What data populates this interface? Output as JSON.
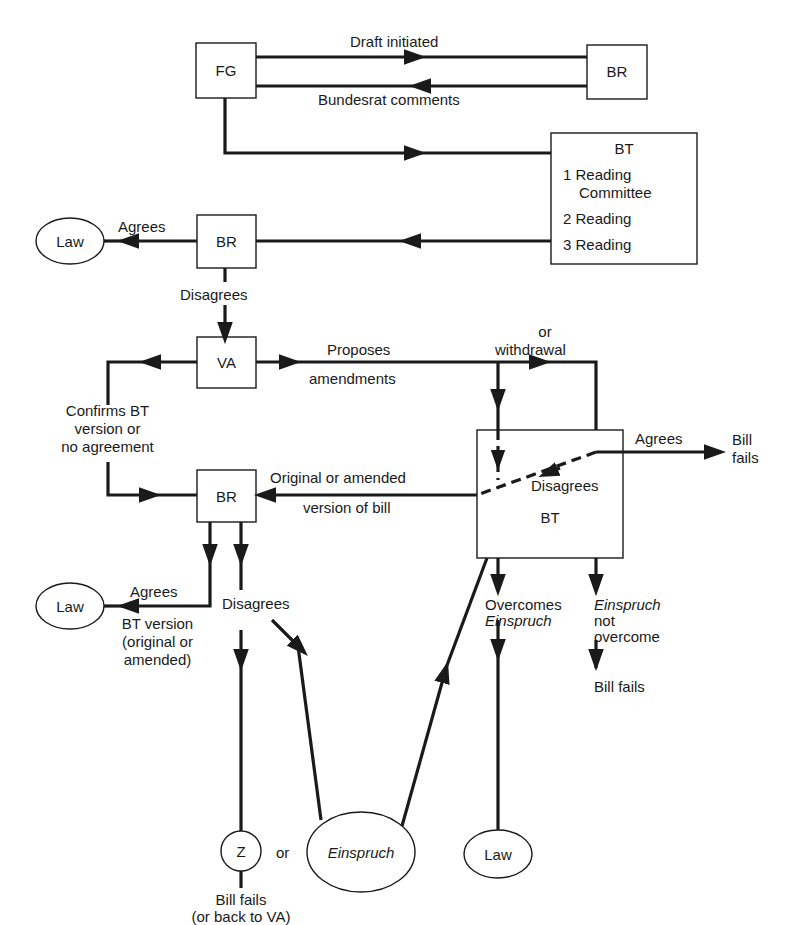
{
  "diagram": {
    "nodes": {
      "fg": {
        "label": "FG"
      },
      "br_top": {
        "label": "BR"
      },
      "bt_top": {
        "label": "BT",
        "stages": [
          "1 Reading",
          "Committee",
          "2 Reading",
          "3 Reading"
        ]
      },
      "br_mid": {
        "label": "BR"
      },
      "law_mid": {
        "label": "Law"
      },
      "va": {
        "label": "VA"
      },
      "bt_low": {
        "label": "BT"
      },
      "br_low": {
        "label": "BR"
      },
      "law_low_left": {
        "label": "Law"
      },
      "z": {
        "label": "Z"
      },
      "einspruch": {
        "label": "Einspruch"
      },
      "law_low_right": {
        "label": "Law"
      }
    },
    "edges": {
      "draft_initiated": "Draft initiated",
      "bundesrat_comments": "Bundesrat comments",
      "br_mid_agrees": "Agrees",
      "br_mid_disagrees": "Disagrees",
      "proposes": "Proposes",
      "amendments": "amendments",
      "or": "or",
      "withdrawal": "withdrawal",
      "confirms_1": "Confirms BT",
      "confirms_2": "version or",
      "confirms_3": "no agreement",
      "bt_agrees": "Agrees",
      "bill_fails_right_1": "Bill",
      "bill_fails_right_2": "fails",
      "bt_disagrees": "Disagrees",
      "orig_amended_1": "Original or amended",
      "orig_amended_2": "version of bill",
      "br_low_agrees": "Agrees",
      "bt_version_1": "BT version",
      "bt_version_2": "(original or",
      "bt_version_3": "amended)",
      "br_low_disagrees": "Disagrees",
      "z_or": "or",
      "bill_fails_z_1": "Bill fails",
      "bill_fails_z_2": "(or back to VA)",
      "overcomes_1": "Overcomes",
      "overcomes_2": "Einspruch",
      "not_overcome_1": "Einspruch",
      "not_overcome_2": "not",
      "not_overcome_3": "overcome",
      "bill_fails_bottom": "Bill fails"
    }
  }
}
